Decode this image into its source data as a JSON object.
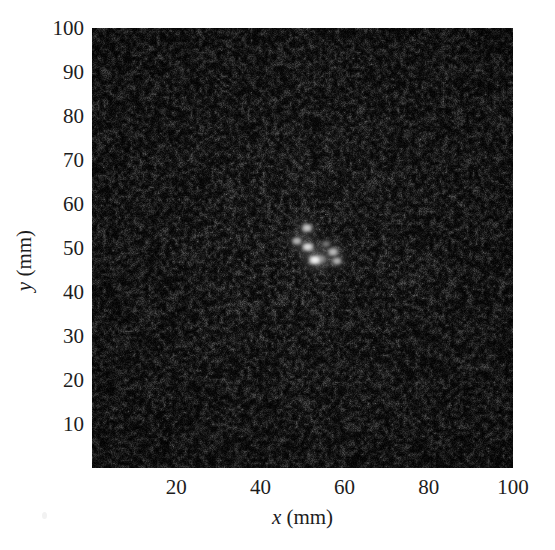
{
  "figure": {
    "background_color": "#ffffff",
    "plot_background_color": "#050505"
  },
  "axes": {
    "x": {
      "title_symbol": "x",
      "title_unit": " (mm)",
      "ticks": [
        20,
        40,
        60,
        80,
        100
      ],
      "range": [
        0,
        100
      ]
    },
    "y": {
      "title_symbol": "y",
      "title_unit": " (mm)",
      "ticks": [
        10,
        20,
        30,
        40,
        50,
        60,
        70,
        80,
        90,
        100
      ],
      "range": [
        0,
        100
      ]
    }
  },
  "chart_data": {
    "type": "heatmap",
    "title": "",
    "xlabel": "x (mm)",
    "ylabel": "y (mm)",
    "xlim": [
      0,
      100
    ],
    "ylim": [
      0,
      100
    ],
    "grid": false,
    "legend": "none",
    "colormap": "gray",
    "background_level": 0.04,
    "noise_description": "speckle noise, near-black background",
    "xtick_labels": [
      "20",
      "40",
      "60",
      "80",
      "100"
    ],
    "ytick_labels": [
      "10",
      "20",
      "30",
      "40",
      "50",
      "60",
      "70",
      "80",
      "90",
      "100"
    ],
    "points": [
      {
        "x": 51.0,
        "y": 54.5,
        "intensity": 0.78,
        "size": 11
      },
      {
        "x": 48.7,
        "y": 51.6,
        "intensity": 0.72,
        "size": 10
      },
      {
        "x": 51.3,
        "y": 50.2,
        "intensity": 0.88,
        "size": 12
      },
      {
        "x": 54.5,
        "y": 47.4,
        "intensity": 0.62,
        "size": 10
      },
      {
        "x": 57.2,
        "y": 49.0,
        "intensity": 0.8,
        "size": 11
      },
      {
        "x": 58.3,
        "y": 47.0,
        "intensity": 0.7,
        "size": 10
      },
      {
        "x": 53.0,
        "y": 47.2,
        "intensity": 0.95,
        "size": 13
      },
      {
        "x": 55.6,
        "y": 51.0,
        "intensity": 0.45,
        "size": 9
      }
    ]
  }
}
